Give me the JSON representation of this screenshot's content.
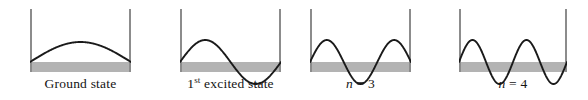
{
  "figure": {
    "background_color": "#ffffff",
    "wall_color": "#8c8c8c",
    "band_color": "#b3b3b3",
    "curve_color": "#1a1a1a",
    "label_color": "#141414"
  },
  "panels": [
    {
      "id": "ground-state",
      "label_prefix": "Ground state",
      "label_sup": "",
      "label_suffix": "",
      "quantum_number": 1,
      "half_wavelengths": 1,
      "amplitude_px": 20,
      "x": 30,
      "width": 101
    },
    {
      "id": "first-excited-state",
      "label_prefix": "1",
      "label_sup": "st",
      "label_suffix": " excited state",
      "quantum_number": 2,
      "half_wavelengths": 2,
      "amplitude_px": 22,
      "x": 180,
      "width": 101
    },
    {
      "id": "n-equals-3",
      "label_prefix": "n",
      "label_sup": "",
      "label_suffix": " = 3",
      "quantum_number": 3,
      "half_wavelengths": 3,
      "amplitude_px": 22,
      "x": 310,
      "width": 101
    },
    {
      "id": "n-equals-4",
      "label_prefix": "n",
      "label_sup": "",
      "label_suffix": " = 4",
      "quantum_number": 4,
      "half_wavelengths": 4,
      "amplitude_px": 22,
      "x": 459,
      "width": 108
    }
  ],
  "geometry": {
    "wall_top_y": 9,
    "baseline_y": 62,
    "band_top_y": 62,
    "band_bottom_y": 72,
    "band_height": 10,
    "wall_thickness": 2
  },
  "chart_data": {
    "type": "line",
    "xlabel": "",
    "ylabel": "",
    "series": [
      {
        "name": "Ground state",
        "n": 1,
        "nodes": 2,
        "antinodes": 1,
        "periods": 0.5
      },
      {
        "name": "1st excited state",
        "n": 2,
        "nodes": 3,
        "antinodes": 2,
        "periods": 1.0
      },
      {
        "name": "n = 3",
        "n": 3,
        "nodes": 4,
        "antinodes": 3,
        "periods": 1.5
      },
      {
        "name": "n = 4",
        "n": 4,
        "nodes": 5,
        "antinodes": 4,
        "periods": 2.0
      }
    ]
  }
}
